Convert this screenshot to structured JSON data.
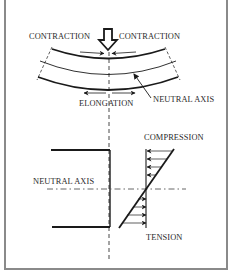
{
  "diagram": {
    "labels": {
      "contraction_left": "CONTRACTION",
      "contraction_right": "CONTRACTION",
      "elongation": "ELONGATION",
      "neutral_axis_top": "NEUTRAL AXIS",
      "neutral_axis_bottom": "NEUTRAL AXIS",
      "compression": "COMPRESSION",
      "tension": "TENSION"
    },
    "elements": {
      "load_arrow": "downward-hollow-arrow",
      "beam": "curved-beam-three-arcs",
      "stress_profile": "linear-stress-triangle"
    },
    "colors": {
      "line": "#1a1a1a",
      "text": "#2a2a2a",
      "frame": "#8a8a8a",
      "background": "#ffffff"
    }
  }
}
